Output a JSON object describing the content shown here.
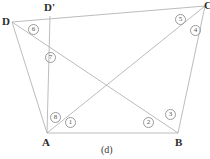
{
  "figure": {
    "caption": "(d)",
    "line_color": "#b4b4b4",
    "label_color": "#2b2b2b",
    "mark_color": "#9a9a9a",
    "background": "#ffffff"
  },
  "vertices": [
    {
      "name": "D",
      "label": "D",
      "x": 12,
      "y": 22,
      "lx": 2,
      "ly": 16
    },
    {
      "name": "Dp",
      "label": "D'",
      "x": 50,
      "y": 16,
      "lx": 44,
      "ly": 2
    },
    {
      "name": "C",
      "label": "C",
      "x": 205,
      "y": 6,
      "lx": 204,
      "ly": 0
    },
    {
      "name": "B",
      "label": "B",
      "x": 178,
      "y": 133,
      "lx": 175,
      "ly": 137
    },
    {
      "name": "A",
      "label": "A",
      "x": 47,
      "y": 133,
      "lx": 42,
      "ly": 137
    }
  ],
  "segments": [
    {
      "name": "D-C-top-edge",
      "x1": 12,
      "y1": 22,
      "x2": 205,
      "y2": 6
    },
    {
      "name": "D-A-side",
      "x1": 12,
      "y1": 22,
      "x2": 47,
      "y2": 133
    },
    {
      "name": "Dprime-A-vert",
      "x1": 50,
      "y1": 16,
      "x2": 47,
      "y2": 133
    },
    {
      "name": "A-B-base",
      "x1": 47,
      "y1": 133,
      "x2": 178,
      "y2": 133
    },
    {
      "name": "B-C-right-side",
      "x1": 178,
      "y1": 133,
      "x2": 205,
      "y2": 6
    },
    {
      "name": "A-C-diagonal",
      "x1": 47,
      "y1": 133,
      "x2": 205,
      "y2": 6
    },
    {
      "name": "D-B-diagonal",
      "x1": 12,
      "y1": 22,
      "x2": 178,
      "y2": 133
    }
  ],
  "angle_marks": [
    {
      "name": "angle-1",
      "label": "1",
      "x": 65,
      "y": 117
    },
    {
      "name": "angle-2",
      "label": "2",
      "x": 143,
      "y": 117
    },
    {
      "name": "angle-3",
      "label": "3",
      "x": 165,
      "y": 109
    },
    {
      "name": "angle-4",
      "label": "4",
      "x": 190,
      "y": 25
    },
    {
      "name": "angle-5",
      "label": "5",
      "x": 175,
      "y": 14
    },
    {
      "name": "angle-6",
      "label": "6",
      "x": 28,
      "y": 24
    },
    {
      "name": "angle-7",
      "label": "7",
      "x": 45,
      "y": 52
    },
    {
      "name": "angle-8",
      "label": "8",
      "x": 50,
      "y": 112
    }
  ],
  "caption_pos": {
    "x": 101,
    "y": 145
  }
}
